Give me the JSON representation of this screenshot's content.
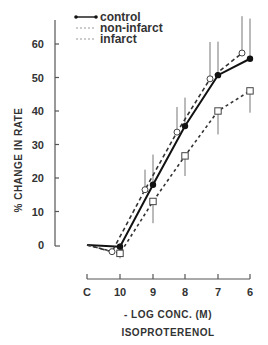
{
  "chart_data": {
    "type": "line",
    "title": "",
    "xlabel": "- LOG CONC. (M)",
    "xlabel2": "ISOPROTERENOL",
    "ylabel": "% CHANGE IN RATE",
    "categories": [
      "C",
      "10",
      "9",
      "8",
      "7",
      "6"
    ],
    "yticks": [
      0,
      10,
      20,
      30,
      40,
      50,
      60
    ],
    "ylim": [
      -3,
      67
    ],
    "grid": false,
    "legend_position": "top-left",
    "series": [
      {
        "name": "control",
        "marker": "filled-circle",
        "line": "solid",
        "values": [
          0,
          -0.5,
          18,
          35.5,
          50.7,
          55.6
        ],
        "error_up": [
          null,
          1,
          9,
          8.5,
          10,
          12
        ]
      },
      {
        "name": "non-infarct",
        "marker": "open-circle",
        "line": "dashed",
        "values": [
          0,
          -2,
          16.5,
          33.7,
          49.6,
          57.3
        ],
        "error_up": [
          null,
          1,
          6,
          7.5,
          11,
          11
        ]
      },
      {
        "name": "infarct",
        "marker": "open-square",
        "line": "dotted-dashed",
        "values": [
          0,
          -2.5,
          13,
          26.6,
          40,
          46
        ],
        "error_down": [
          null,
          1.5,
          6.5,
          6,
          7,
          6.5
        ]
      }
    ]
  },
  "legend": {
    "items": [
      {
        "label": "control"
      },
      {
        "label": "non-infarct"
      },
      {
        "label": "infarct"
      }
    ]
  },
  "axes": {
    "ylabel": "% CHANGE IN RATE",
    "xlabel": "- LOG CONC. (M)",
    "xlabel2": "ISOPROTERENOL",
    "yticks": [
      "0",
      "10",
      "20",
      "30",
      "40",
      "50",
      "60"
    ],
    "xticks": [
      "C",
      "10",
      "9",
      "8",
      "7",
      "6"
    ]
  }
}
